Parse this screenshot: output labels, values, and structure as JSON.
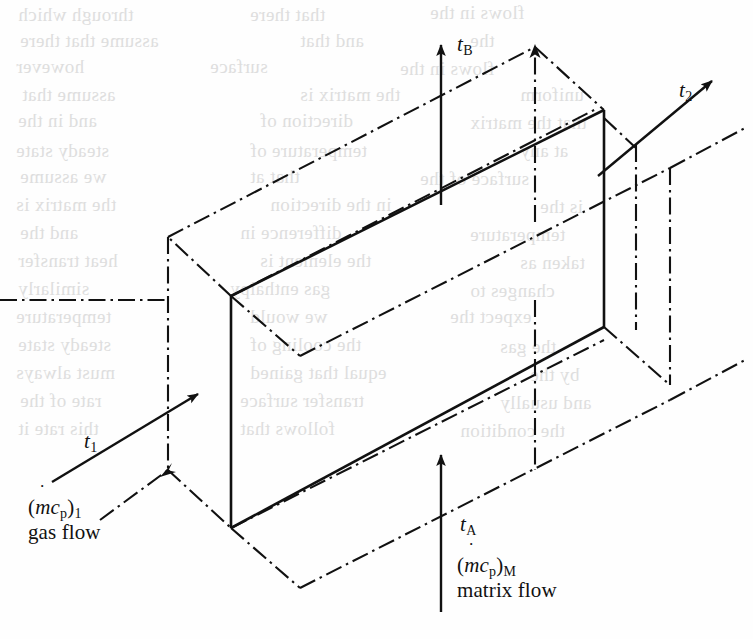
{
  "figure": {
    "kind": "isometric-technical-diagram",
    "background_color": "#fefefe",
    "line_color": "#111111"
  },
  "labels": {
    "t_b": {
      "symbol": "t",
      "subscript": "B"
    },
    "t_2": {
      "symbol": "t",
      "subscript": "2"
    },
    "t_1": {
      "symbol": "t",
      "subscript": "1"
    },
    "t_a": {
      "symbol": "t",
      "subscript": "A"
    }
  },
  "flows": {
    "gas": {
      "expr_open": "(",
      "expr_m": "m",
      "expr_c": "c",
      "expr_c_sub": "p",
      "expr_close": ")",
      "expr_sub": "1",
      "name": "gas flow"
    },
    "matrix": {
      "expr_open": "(",
      "expr_m": "m",
      "expr_c": "c",
      "expr_c_sub": "p",
      "expr_close": ")",
      "expr_sub": "M",
      "name": "matrix flow"
    }
  },
  "bleed_text": {
    "lines": [
      {
        "text": "through which",
        "x": 18,
        "y": 4,
        "size": 19
      },
      {
        "text": "that there",
        "x": 250,
        "y": 4,
        "size": 19
      },
      {
        "text": "flows in the",
        "x": 430,
        "y": 2,
        "size": 19
      },
      {
        "text": "assume that there",
        "x": 20,
        "y": 30,
        "size": 19
      },
      {
        "text": "and that",
        "x": 300,
        "y": 30,
        "size": 19
      },
      {
        "text": "the",
        "x": 470,
        "y": 30,
        "size": 19
      },
      {
        "text": "however",
        "x": 16,
        "y": 56,
        "size": 19
      },
      {
        "text": "surface",
        "x": 210,
        "y": 56,
        "size": 19
      },
      {
        "text": "flows in the",
        "x": 400,
        "y": 58,
        "size": 19
      },
      {
        "text": "assume that",
        "x": 22,
        "y": 84,
        "size": 19
      },
      {
        "text": "the matrix is",
        "x": 300,
        "y": 84,
        "size": 19
      },
      {
        "text": "uniform",
        "x": 520,
        "y": 84,
        "size": 19
      },
      {
        "text": "and in the",
        "x": 18,
        "y": 110,
        "size": 19
      },
      {
        "text": "direction of",
        "x": 260,
        "y": 110,
        "size": 19
      },
      {
        "text": "that the matrix",
        "x": 470,
        "y": 112,
        "size": 19
      },
      {
        "text": "steady state",
        "x": 16,
        "y": 140,
        "size": 19
      },
      {
        "text": "temperature of",
        "x": 250,
        "y": 140,
        "size": 19
      },
      {
        "text": "at any",
        "x": 520,
        "y": 140,
        "size": 19
      },
      {
        "text": "we assume",
        "x": 20,
        "y": 166,
        "size": 19
      },
      {
        "text": "that at",
        "x": 250,
        "y": 166,
        "size": 19
      },
      {
        "text": "surface of the",
        "x": 420,
        "y": 168,
        "size": 19
      },
      {
        "text": "the matrix is",
        "x": 16,
        "y": 194,
        "size": 19
      },
      {
        "text": "in the direction",
        "x": 270,
        "y": 194,
        "size": 19
      },
      {
        "text": "is the",
        "x": 540,
        "y": 196,
        "size": 19
      },
      {
        "text": "and the",
        "x": 20,
        "y": 222,
        "size": 19
      },
      {
        "text": "difference in",
        "x": 240,
        "y": 222,
        "size": 19
      },
      {
        "text": "temperature",
        "x": 470,
        "y": 224,
        "size": 19
      },
      {
        "text": "heat transfer",
        "x": 18,
        "y": 250,
        "size": 19
      },
      {
        "text": "the element is",
        "x": 260,
        "y": 250,
        "size": 19
      },
      {
        "text": "taken as",
        "x": 520,
        "y": 252,
        "size": 19
      },
      {
        "text": "similarly",
        "x": 18,
        "y": 278,
        "size": 19
      },
      {
        "text": "gas enthalpy",
        "x": 230,
        "y": 278,
        "size": 19
      },
      {
        "text": "changes to",
        "x": 470,
        "y": 280,
        "size": 19
      },
      {
        "text": "temperature",
        "x": 16,
        "y": 306,
        "size": 19
      },
      {
        "text": "we would",
        "x": 250,
        "y": 306,
        "size": 19
      },
      {
        "text": "expect the",
        "x": 450,
        "y": 306,
        "size": 19
      },
      {
        "text": "steady state",
        "x": 18,
        "y": 334,
        "size": 19
      },
      {
        "text": "the cooling of",
        "x": 250,
        "y": 334,
        "size": 19
      },
      {
        "text": "the gas",
        "x": 500,
        "y": 336,
        "size": 19
      },
      {
        "text": "must always",
        "x": 16,
        "y": 362,
        "size": 19
      },
      {
        "text": "equal that gained",
        "x": 250,
        "y": 362,
        "size": 19
      },
      {
        "text": "by the",
        "x": 530,
        "y": 364,
        "size": 19
      },
      {
        "text": "rate of the",
        "x": 20,
        "y": 390,
        "size": 19
      },
      {
        "text": "transfer surface",
        "x": 240,
        "y": 390,
        "size": 19
      },
      {
        "text": "and usually",
        "x": 500,
        "y": 392,
        "size": 19
      },
      {
        "text": "this rate it",
        "x": 18,
        "y": 418,
        "size": 19
      },
      {
        "text": "follows that",
        "x": 240,
        "y": 418,
        "size": 19
      },
      {
        "text": "the condition",
        "x": 460,
        "y": 420,
        "size": 19
      }
    ]
  },
  "geometry": {
    "solid_face": {
      "description": "Front visible rectangular slab face of the matrix element",
      "corners": [
        [
          231,
          296
        ],
        [
          604,
          110
        ],
        [
          604,
          327
        ],
        [
          231,
          528
        ]
      ]
    },
    "arrows": [
      {
        "name": "t_B",
        "from": [
          441,
          205
        ],
        "to": [
          441,
          42
        ],
        "style": "solid"
      },
      {
        "name": "t_2",
        "from": [
          600,
          175
        ],
        "to": [
          717,
          78
        ],
        "style": "solid"
      },
      {
        "name": "t_1",
        "from": [
          52,
          482
        ],
        "to": [
          200,
          392
        ],
        "style": "solid"
      },
      {
        "name": "t_A",
        "from": [
          441,
          612
        ],
        "to": [
          441,
          452
        ],
        "style": "solid"
      },
      {
        "name": "top-hidden-apex",
        "from": [
          535,
          222
        ],
        "to": [
          535,
          45
        ],
        "style": "dash-dot"
      }
    ]
  }
}
